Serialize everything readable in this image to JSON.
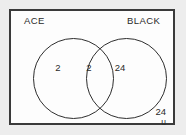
{
  "diagram": {
    "type": "venn-two-set",
    "universe": {
      "symbol": "u",
      "outside_count": "24"
    },
    "sets": [
      {
        "id": "ace",
        "label": "ACE",
        "only_count": "2"
      },
      {
        "id": "black",
        "label": "BLACK",
        "only_count": "24"
      }
    ],
    "intersection": {
      "label": "ACE and BLACK",
      "count": "2"
    },
    "colors": {
      "border": "#3a3a3a",
      "circle_stroke": "#2e2e2e",
      "text": "#2a2a2a",
      "page_background": "#e9e9e9",
      "panel_background": "#fdfdfd"
    }
  }
}
